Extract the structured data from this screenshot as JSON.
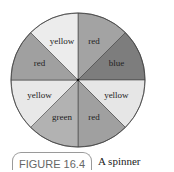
{
  "chart_data": {
    "type": "pie",
    "title": "A spinner",
    "figure_label": "FIGURE 16.4",
    "categories": [
      "red",
      "blue",
      "yellow",
      "red",
      "green",
      "yellow",
      "red",
      "yellow"
    ],
    "values": [
      1,
      1,
      1,
      1,
      1,
      1,
      1,
      1
    ],
    "colors": [
      "#a3a3a3",
      "#7d7d7d",
      "#e6e6e6",
      "#a0a0a0",
      "#b2b2b2",
      "#e8e8e8",
      "#a0a0a0",
      "#ececec"
    ]
  },
  "caption": {
    "figure_label": "FIGURE 16.4",
    "text": "A spinner"
  }
}
